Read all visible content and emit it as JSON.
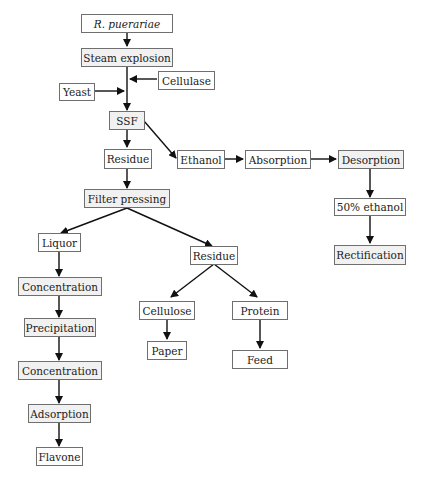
{
  "diagram": {
    "type": "process-flowchart",
    "nodes": {
      "r_puerariae": "R. puerariae",
      "steam_explosion": "Steam explosion",
      "cellulase": "Cellulase",
      "yeast": "Yeast",
      "ssf": "SSF",
      "residue_1": "Residue",
      "ethanol": "Ethanol",
      "absorption": "Absorption",
      "desorption": "Desorption",
      "ethanol_50": "50% ethanol",
      "rectification": "Rectification",
      "filter_pressing": "Filter pressing",
      "liquor": "Liquor",
      "residue_2": "Residue",
      "concentration_1": "Concentration",
      "precipitation": "Precipitation",
      "concentration_2": "Concentration",
      "adsorption": "Adsorption",
      "flavone": "Flavone",
      "cellulose": "Cellulose",
      "paper": "Paper",
      "protein": "Protein",
      "feed": "Feed"
    },
    "edges": [
      [
        "R. puerariae",
        "Steam explosion"
      ],
      [
        "Steam explosion",
        "SSF"
      ],
      [
        "Cellulase",
        "SSF"
      ],
      [
        "Yeast",
        "SSF"
      ],
      [
        "SSF",
        "Residue"
      ],
      [
        "SSF",
        "Ethanol"
      ],
      [
        "Ethanol",
        "Absorption"
      ],
      [
        "Absorption",
        "Desorption"
      ],
      [
        "Desorption",
        "50% ethanol"
      ],
      [
        "50% ethanol",
        "Rectification"
      ],
      [
        "Residue",
        "Filter pressing"
      ],
      [
        "Filter pressing",
        "Liquor"
      ],
      [
        "Filter pressing",
        "Residue (2)"
      ],
      [
        "Liquor",
        "Concentration"
      ],
      [
        "Concentration",
        "Precipitation"
      ],
      [
        "Precipitation",
        "Concentration (2)"
      ],
      [
        "Concentration (2)",
        "Adsorption"
      ],
      [
        "Adsorption",
        "Flavone"
      ],
      [
        "Residue (2)",
        "Cellulose"
      ],
      [
        "Residue (2)",
        "Protein"
      ],
      [
        "Cellulose",
        "Paper"
      ],
      [
        "Protein",
        "Feed"
      ]
    ],
    "colors": {
      "border": "#6f6f6f",
      "line": "#111111",
      "shaded_fill": "#f1f1f1"
    }
  }
}
